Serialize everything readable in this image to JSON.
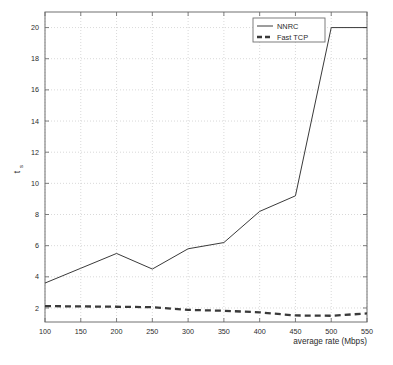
{
  "figure": {
    "background_color": "#ffffff",
    "plot_frame_color": "#707070",
    "grid_color": "#c8c8c8",
    "series_color": "#3a3a3a"
  },
  "chart_data": {
    "type": "line",
    "title": "",
    "xlabel": "average rate (Mbps)",
    "ylabel": "t_s",
    "ylabel_main": "t",
    "ylabel_sub": "s",
    "x": [
      100,
      150,
      200,
      250,
      300,
      350,
      400,
      450,
      500,
      550
    ],
    "xticks": [
      100,
      150,
      200,
      250,
      300,
      350,
      400,
      450,
      500,
      550
    ],
    "yticks": [
      2,
      4,
      6,
      8,
      10,
      12,
      14,
      16,
      18,
      20
    ],
    "xlim": [
      100,
      550
    ],
    "ylim": [
      1.1,
      21.0
    ],
    "grid": true,
    "legend_position": "top-right",
    "series": [
      {
        "name": "NNRC",
        "style": "solid",
        "values": [
          3.6,
          4.55,
          5.5,
          4.5,
          5.8,
          6.2,
          8.2,
          9.2,
          20.0,
          20.0
        ]
      },
      {
        "name": "Fast TCP",
        "style": "dashed",
        "values": [
          2.12,
          2.1,
          2.08,
          2.05,
          1.88,
          1.82,
          1.72,
          1.52,
          1.5,
          1.65
        ]
      }
    ]
  },
  "legend": {
    "entries": [
      {
        "label": "NNRC",
        "style": "solid"
      },
      {
        "label": "Fast TCP",
        "style": "dashed"
      }
    ]
  }
}
